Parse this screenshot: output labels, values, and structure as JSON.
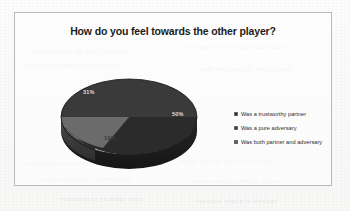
{
  "chart_data": {
    "type": "pie",
    "title": "How do you feel towards the other player?",
    "categories": [
      "Was a trustworthy partner",
      "Was a pure adversary",
      "Was both partner and adversary"
    ],
    "values": [
      50,
      31,
      19
    ],
    "value_labels": [
      "50%",
      "31%",
      "19%"
    ],
    "colors": [
      "#2b2b2b",
      "#3d3d3d",
      "#6e6e6e"
    ],
    "legend_position": "right",
    "grid": false,
    "xlabel": "",
    "ylabel": "",
    "three_d": true
  },
  "legend": {
    "items": [
      {
        "label": "Was a trustworthy partner",
        "color": "#2b2b2b"
      },
      {
        "label": "Was a pure adversary",
        "color": "#3d3d3d"
      },
      {
        "label": "Was both partner and adversary",
        "color": "#5c5c5c"
      }
    ]
  },
  "slices": [
    {
      "label": "50%"
    },
    {
      "label": "31%"
    },
    {
      "label": "19%"
    }
  ],
  "bleed_text": [
    {
      "text": "continued from the previous page",
      "left": 30,
      "top": 48
    },
    {
      "text": "of trust and reciprocity in repeated",
      "left": 186,
      "top": 44
    },
    {
      "text": "the results are summarised below",
      "left": 22,
      "top": 62
    },
    {
      "text": "participants reported that they",
      "left": 200,
      "top": 66
    },
    {
      "text": "were asked to rate the partner",
      "left": 26,
      "top": 160
    },
    {
      "text": "and the outcome of each round",
      "left": 180,
      "top": 158
    },
    {
      "text": "experimental condition results",
      "left": 40,
      "top": 176
    },
    {
      "text": "social dilemma game sessions",
      "left": 190,
      "top": 178
    },
    {
      "text": "table summary of responses",
      "left": 60,
      "top": 196
    },
    {
      "text": "analysis of player attitudes",
      "left": 196,
      "top": 198
    }
  ]
}
